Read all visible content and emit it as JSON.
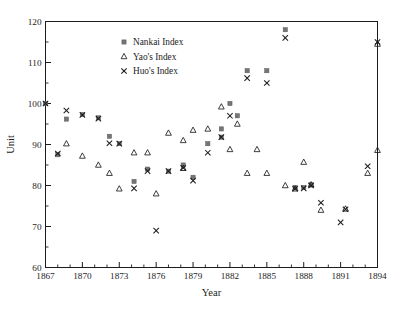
{
  "chart_data": {
    "type": "scatter",
    "title": "",
    "xlabel": "Year",
    "ylabel": "Unit",
    "xlim": [
      1867,
      1894
    ],
    "ylim": [
      60,
      120
    ],
    "x_major_ticks": [
      1867,
      1870,
      1873,
      1876,
      1879,
      1882,
      1885,
      1888,
      1891,
      1894
    ],
    "x_tick_labels": [
      "1867",
      "1870",
      "1873",
      "1876",
      "1879",
      "1882",
      "1885",
      "1888",
      "1891",
      "1894"
    ],
    "x_minor_step": 1,
    "y_major_ticks": [
      60,
      70,
      80,
      90,
      100,
      110,
      120
    ],
    "y_tick_labels": [
      "60",
      "70",
      "80",
      "90",
      "100",
      "110",
      "120"
    ],
    "y_minor_step": 5,
    "grid": false,
    "legend_position": "upper-center-left",
    "series": [
      {
        "name": "Nankai Index",
        "marker": "square",
        "color": "#757575",
        "points": [
          [
            1867,
            100.0
          ],
          [
            1868,
            87.5
          ],
          [
            1868.7,
            96.2
          ],
          [
            1870,
            97.3
          ],
          [
            1871.3,
            96.5
          ],
          [
            1872.2,
            92.0
          ],
          [
            1873,
            90.2
          ],
          [
            1874.2,
            81.0
          ],
          [
            1875.3,
            84.0
          ],
          [
            1877,
            83.5
          ],
          [
            1878.2,
            85.0
          ],
          [
            1879,
            82.0
          ],
          [
            1880.2,
            90.2
          ],
          [
            1881.3,
            93.8
          ],
          [
            1881.3,
            91.8
          ],
          [
            1882,
            100.0
          ],
          [
            1882.6,
            97.0
          ],
          [
            1883.4,
            108.0
          ],
          [
            1885,
            108.0
          ],
          [
            1886.5,
            118.0
          ],
          [
            1887.3,
            79.5
          ],
          [
            1888,
            79.5
          ],
          [
            1888.6,
            80.2
          ]
        ]
      },
      {
        "name": "Yao's Index",
        "marker": "triangle",
        "color": "#1c1c1c",
        "points": [
          [
            1868.7,
            90.2
          ],
          [
            1870,
            87.2
          ],
          [
            1871.3,
            85.0
          ],
          [
            1872.2,
            83.0
          ],
          [
            1873,
            79.2
          ],
          [
            1874.2,
            88.0
          ],
          [
            1875.3,
            88.0
          ],
          [
            1876,
            78.0
          ],
          [
            1877,
            92.8
          ],
          [
            1878.2,
            91.0
          ],
          [
            1878.2,
            84.2
          ],
          [
            1879,
            93.5
          ],
          [
            1880.2,
            93.8
          ],
          [
            1881.3,
            99.2
          ],
          [
            1882,
            88.8
          ],
          [
            1882.6,
            95.0
          ],
          [
            1883.4,
            83.0
          ],
          [
            1884.2,
            88.8
          ],
          [
            1885,
            83.0
          ],
          [
            1886.5,
            80.0
          ],
          [
            1887.3,
            79.2
          ],
          [
            1888,
            85.7
          ],
          [
            1888.6,
            80.2
          ],
          [
            1889.4,
            74.0
          ],
          [
            1891.4,
            74.3
          ],
          [
            1893.2,
            83.0
          ],
          [
            1894,
            88.6
          ],
          [
            1894,
            114.5
          ]
        ]
      },
      {
        "name": "Huo's Index",
        "marker": "x",
        "color": "#1c1c1c",
        "points": [
          [
            1867,
            100.0
          ],
          [
            1868,
            87.8
          ],
          [
            1868.7,
            98.3
          ],
          [
            1870,
            97.2
          ],
          [
            1871.3,
            96.3
          ],
          [
            1872.2,
            90.3
          ],
          [
            1873,
            90.2
          ],
          [
            1874.2,
            79.3
          ],
          [
            1875.3,
            83.5
          ],
          [
            1876,
            69.0
          ],
          [
            1877,
            83.5
          ],
          [
            1878.2,
            84.3
          ],
          [
            1879,
            81.2
          ],
          [
            1880.2,
            88.0
          ],
          [
            1881.3,
            91.8
          ],
          [
            1882,
            97.0
          ],
          [
            1883.4,
            106.2
          ],
          [
            1885,
            105.0
          ],
          [
            1886.5,
            116.0
          ],
          [
            1887.3,
            79.2
          ],
          [
            1888,
            79.3
          ],
          [
            1888.6,
            80.0
          ],
          [
            1889.4,
            75.8
          ],
          [
            1891,
            71.0
          ],
          [
            1891.4,
            74.2
          ],
          [
            1893.2,
            84.7
          ],
          [
            1894,
            115.0
          ]
        ]
      }
    ]
  },
  "legend": {
    "items": [
      {
        "label": "Nankai Index",
        "marker": "square"
      },
      {
        "label": "Yao's Index",
        "marker": "triangle"
      },
      {
        "label": "Huo's Index",
        "marker": "x"
      }
    ]
  }
}
